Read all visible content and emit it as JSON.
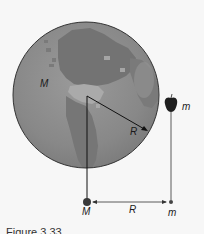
{
  "diagram": {
    "earth": {
      "label": "M",
      "radius_label": "R",
      "colors": {
        "ocean": "#8a8a8a",
        "land": "#747474",
        "land_light": "#b0b0b0",
        "outline": "#333333"
      }
    },
    "apple": {
      "label": "m",
      "color": "#1e1e1e"
    },
    "equivalent": {
      "big_mass_label": "M",
      "small_mass_label": "m",
      "distance_label": "R"
    },
    "caption": "Figure 3.33"
  }
}
